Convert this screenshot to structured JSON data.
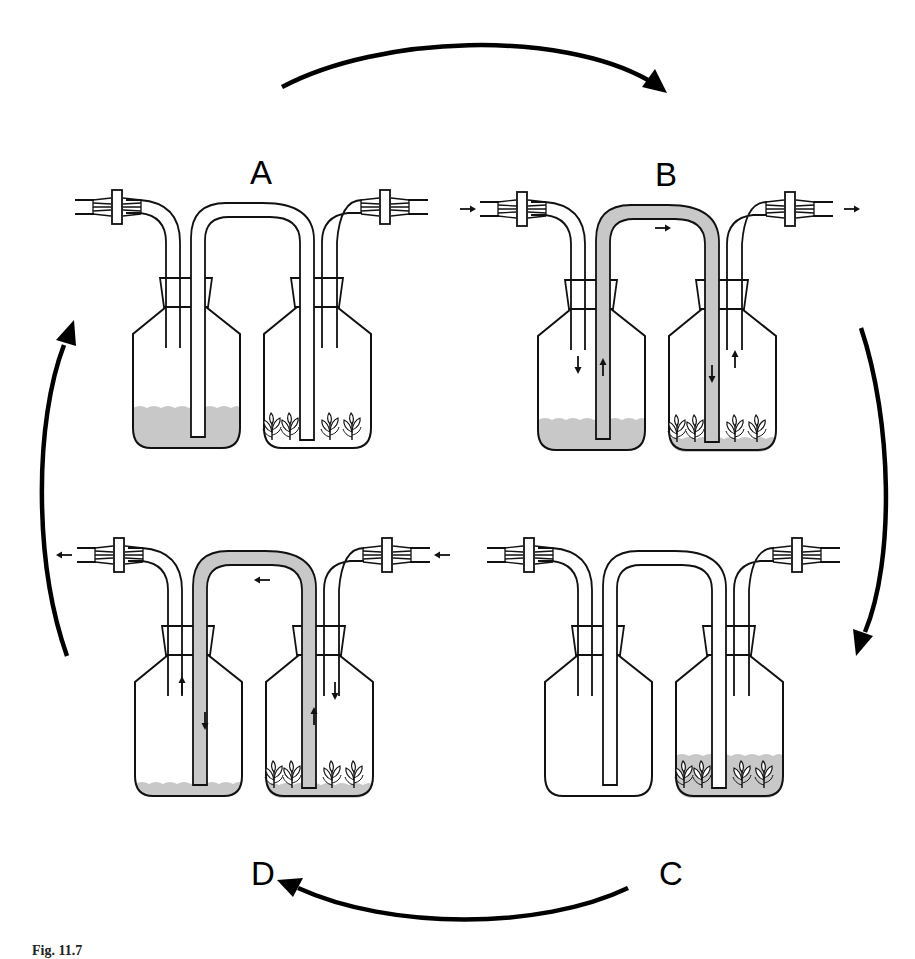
{
  "figure": {
    "type": "cyclic process diagram",
    "cycle_order": [
      "A",
      "B",
      "C",
      "D"
    ],
    "colors": {
      "line": "#111111",
      "medium": "#c8c8c8",
      "background": "#ffffff"
    },
    "panels": [
      {
        "id": "A",
        "label": "A",
        "position": "top-left",
        "state": "rest - medium in left reservoir flask, plants in right culture flask not immersed",
        "left_flask_medium": "high",
        "right_flask_medium": "none",
        "siphon_tube_filled": false,
        "flow_direction": "none",
        "arrows": []
      },
      {
        "id": "B",
        "label": "B",
        "position": "top-right",
        "state": "air pressure applied at left inlet pushes medium through connecting tube into right culture flask",
        "left_flask_medium": "medium",
        "right_flask_medium": "low",
        "siphon_tube_filled": true,
        "flow_direction": "left-to-right",
        "arrows": [
          "inlet-right",
          "tube-right",
          "left-flask-down",
          "siphon-up-left",
          "siphon-down-right",
          "right-flask-up",
          "outlet-right"
        ]
      },
      {
        "id": "C",
        "label": "C",
        "position": "bottom-right",
        "state": "plants immersed - medium in right culture flask, left reservoir empty",
        "left_flask_medium": "none",
        "right_flask_medium": "high",
        "siphon_tube_filled": false,
        "flow_direction": "none",
        "arrows": []
      },
      {
        "id": "D",
        "label": "D",
        "position": "bottom-left",
        "state": "air pressure applied at right inlet pushes medium back into left reservoir flask",
        "left_flask_medium": "low",
        "right_flask_medium": "low",
        "siphon_tube_filled": true,
        "flow_direction": "right-to-left",
        "arrows": [
          "inlet-left",
          "tube-left",
          "left-flask-up",
          "siphon-down-left",
          "siphon-up-right",
          "right-flask-down",
          "outlet-left"
        ]
      }
    ],
    "cycle_arrows": [
      {
        "from": "A",
        "to": "B",
        "position": "top"
      },
      {
        "from": "B",
        "to": "C",
        "position": "right"
      },
      {
        "from": "C",
        "to": "D",
        "position": "bottom"
      },
      {
        "from": "D",
        "to": "A",
        "position": "left"
      }
    ]
  },
  "caption": {
    "visible": "partially clipped",
    "prefix": "Fig. 11.7"
  }
}
